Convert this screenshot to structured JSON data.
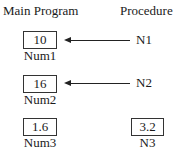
{
  "headings": {
    "main_program": "Main Program",
    "procedure": "Procedure"
  },
  "rows": [
    {
      "main_value": "10",
      "main_label": "Num1",
      "proc_label": "N1",
      "arrow": true
    },
    {
      "main_value": "16",
      "main_label": "Num2",
      "proc_label": "N2",
      "arrow": true
    },
    {
      "main_value": "1.6",
      "main_label": "Num3",
      "proc_value": "3.2",
      "proc_label": "N3",
      "arrow": false
    }
  ]
}
